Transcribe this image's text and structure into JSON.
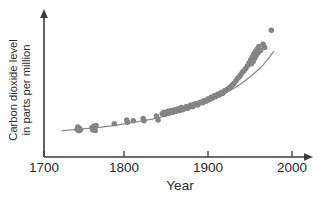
{
  "chart_data": {
    "type": "scatter",
    "title": "",
    "xlabel": "Year",
    "ylabel": "Carbon dioxide level in parts per million",
    "ylabel_line1": "Carbon dioxide level",
    "ylabel_line2": "in parts per million",
    "xlim": [
      1700,
      2010
    ],
    "ylim": [
      270,
      345
    ],
    "xticks": [
      1700,
      1800,
      1900,
      2000
    ],
    "xtick_labels": [
      "1700",
      "1800",
      "1900",
      "2000"
    ],
    "yticks": [],
    "ytick_labels": [],
    "grid": false,
    "legend": false,
    "legend_position": "none",
    "axis_style": "arrow-ended L-shaped axes, y-axis unlabeled",
    "marker_color": "#858585",
    "curve_color": "#8a8a8a",
    "axis_color": "#3c3c3c",
    "text_color": "#2b2b2b",
    "background_color": "#ffffff",
    "series": [
      {
        "name": "Atmospheric CO2 measurements",
        "marker": "circle",
        "points": [
          [
            1740,
            277.5
          ],
          [
            1741,
            279.0
          ],
          [
            1742,
            276.5
          ],
          [
            1743,
            278.0
          ],
          [
            1744,
            277.0
          ],
          [
            1758,
            278.5
          ],
          [
            1759,
            277.0
          ],
          [
            1760,
            279.5
          ],
          [
            1761,
            278.0
          ],
          [
            1762,
            276.8
          ],
          [
            1763,
            280.0
          ],
          [
            1785,
            281.0
          ],
          [
            1800,
            283.5
          ],
          [
            1801,
            282.0
          ],
          [
            1808,
            283.0
          ],
          [
            1820,
            284.5
          ],
          [
            1821,
            283.0
          ],
          [
            1836,
            286.0
          ],
          [
            1838,
            283.5
          ],
          [
            1843,
            287.5
          ],
          [
            1845,
            288.5
          ],
          [
            1846,
            287.0
          ],
          [
            1848,
            288.0
          ],
          [
            1850,
            289.0
          ],
          [
            1852,
            288.0
          ],
          [
            1854,
            289.5
          ],
          [
            1856,
            288.5
          ],
          [
            1858,
            290.0
          ],
          [
            1860,
            289.0
          ],
          [
            1862,
            290.5
          ],
          [
            1864,
            289.5
          ],
          [
            1866,
            291.5
          ],
          [
            1868,
            290.0
          ],
          [
            1870,
            291.0
          ],
          [
            1872,
            292.0
          ],
          [
            1874,
            291.0
          ],
          [
            1876,
            292.5
          ],
          [
            1878,
            293.0
          ],
          [
            1880,
            292.0
          ],
          [
            1882,
            293.5
          ],
          [
            1884,
            294.0
          ],
          [
            1886,
            293.0
          ],
          [
            1888,
            294.5
          ],
          [
            1890,
            295.0
          ],
          [
            1892,
            294.5
          ],
          [
            1894,
            296.0
          ],
          [
            1896,
            295.5
          ],
          [
            1898,
            297.0
          ],
          [
            1900,
            296.5
          ],
          [
            1902,
            298.0
          ],
          [
            1904,
            297.5
          ],
          [
            1906,
            299.0
          ],
          [
            1908,
            298.5
          ],
          [
            1910,
            300.0
          ],
          [
            1912,
            299.5
          ],
          [
            1914,
            301.0
          ],
          [
            1916,
            300.5
          ],
          [
            1918,
            302.0
          ],
          [
            1920,
            302.5
          ],
          [
            1922,
            303.0
          ],
          [
            1924,
            304.0
          ],
          [
            1926,
            305.0
          ],
          [
            1928,
            306.0
          ],
          [
            1930,
            307.0
          ],
          [
            1932,
            308.5
          ],
          [
            1934,
            310.0
          ],
          [
            1936,
            311.0
          ],
          [
            1938,
            312.5
          ],
          [
            1940,
            314.0
          ],
          [
            1942,
            315.0
          ],
          [
            1944,
            316.5
          ],
          [
            1946,
            318.0
          ],
          [
            1948,
            320.0
          ],
          [
            1950,
            322.0
          ],
          [
            1951,
            319.5
          ],
          [
            1952,
            324.0
          ],
          [
            1953,
            321.0
          ],
          [
            1954,
            326.0
          ],
          [
            1955,
            323.0
          ],
          [
            1956,
            327.5
          ],
          [
            1957,
            325.0
          ],
          [
            1958,
            329.0
          ],
          [
            1959,
            326.5
          ],
          [
            1960,
            330.5
          ],
          [
            1962,
            328.0
          ],
          [
            1965,
            332.0
          ],
          [
            1967,
            330.0
          ],
          [
            1975,
            341.0
          ]
        ]
      }
    ],
    "fit_curve": {
      "name": "exponential trend line",
      "description": "smooth increasing curve fitted through the scatter",
      "x_start": 1722,
      "x_end": 1978,
      "points": [
        [
          1722,
          276.6
        ],
        [
          1740,
          277.4
        ],
        [
          1760,
          278.4
        ],
        [
          1780,
          279.6
        ],
        [
          1800,
          281.2
        ],
        [
          1820,
          283.0
        ],
        [
          1840,
          285.2
        ],
        [
          1860,
          288.0
        ],
        [
          1880,
          291.4
        ],
        [
          1900,
          295.6
        ],
        [
          1920,
          300.8
        ],
        [
          1940,
          307.4
        ],
        [
          1960,
          316.0
        ],
        [
          1970,
          322.0
        ],
        [
          1978,
          327.5
        ]
      ]
    }
  },
  "axes": {
    "x_title": "Year",
    "y_title_line1": "Carbon dioxide level",
    "y_title_line2": "in parts per million",
    "x_tick_1": "1700",
    "x_tick_2": "1800",
    "x_tick_3": "1900",
    "x_tick_4": "2000"
  }
}
